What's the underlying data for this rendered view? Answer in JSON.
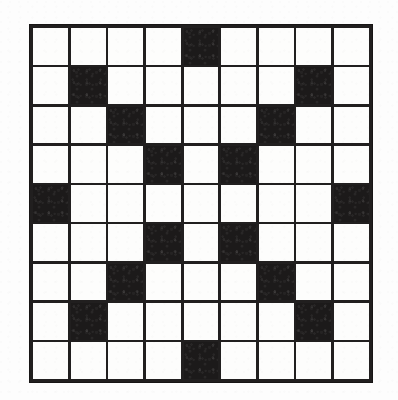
{
  "document": {
    "kind": "crossword-puzzle-grid",
    "title": "Crossword Grid",
    "page_background_color": "#fdfdfd"
  },
  "grid": {
    "rows": 9,
    "columns": 9,
    "cell_label_white": "open square",
    "cell_label_black": "blocked square",
    "white_color": "#fdfdfc",
    "black_color": "#1c1a1a",
    "line_color": "#211f1f",
    "symmetry": "180-degree rotational",
    "black_square_count": 17,
    "white_square_count": 64,
    "cells": [
      [
        0,
        0,
        0,
        0,
        1,
        0,
        0,
        0,
        0
      ],
      [
        0,
        1,
        0,
        0,
        0,
        0,
        0,
        1,
        0
      ],
      [
        0,
        0,
        1,
        0,
        0,
        0,
        1,
        0,
        0
      ],
      [
        0,
        0,
        0,
        1,
        0,
        1,
        0,
        0,
        0
      ],
      [
        1,
        0,
        0,
        0,
        0,
        0,
        0,
        0,
        1
      ],
      [
        0,
        0,
        0,
        1,
        0,
        1,
        0,
        0,
        0
      ],
      [
        0,
        0,
        1,
        0,
        0,
        0,
        1,
        0,
        0
      ],
      [
        0,
        1,
        0,
        0,
        0,
        0,
        0,
        1,
        0
      ],
      [
        0,
        0,
        0,
        0,
        1,
        0,
        0,
        0,
        0
      ]
    ]
  }
}
